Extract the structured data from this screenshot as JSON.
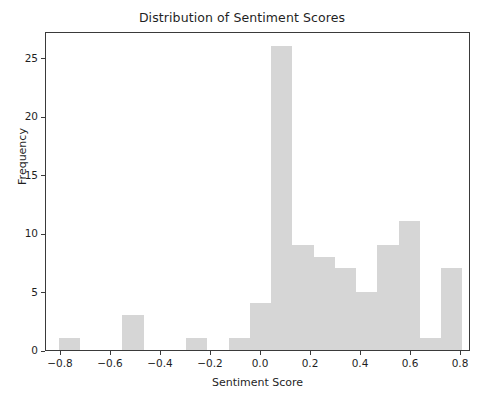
{
  "chart_data": {
    "type": "bar",
    "title": "Distribution of Sentiment Scores",
    "xlabel": "Sentiment Score",
    "ylabel": "Frequency",
    "xlim": [
      -0.86,
      0.84
    ],
    "ylim": [
      0,
      27.3
    ],
    "grid": false,
    "legend": null,
    "bar_color": "#d6d6d6",
    "xticks": [
      -0.8,
      -0.6,
      -0.4,
      -0.2,
      0.0,
      0.2,
      0.4,
      0.6,
      0.8
    ],
    "xtick_labels": [
      "−0.8",
      "−0.6",
      "−0.4",
      "−0.2",
      "0.0",
      "0.2",
      "0.4",
      "0.6",
      "0.8"
    ],
    "yticks": [
      0,
      5,
      10,
      15,
      20,
      25
    ],
    "ytick_labels": [
      "0",
      "5",
      "10",
      "15",
      "20",
      "25"
    ],
    "bins": [
      {
        "left": -0.81,
        "right": -0.725,
        "value": 1
      },
      {
        "left": -0.725,
        "right": -0.64,
        "value": 0
      },
      {
        "left": -0.64,
        "right": -0.555,
        "value": 0
      },
      {
        "left": -0.555,
        "right": -0.47,
        "value": 3
      },
      {
        "left": -0.47,
        "right": -0.385,
        "value": 0
      },
      {
        "left": -0.385,
        "right": -0.3,
        "value": 0
      },
      {
        "left": -0.3,
        "right": -0.215,
        "value": 1
      },
      {
        "left": -0.215,
        "right": -0.13,
        "value": 0
      },
      {
        "left": -0.13,
        "right": -0.045,
        "value": 1
      },
      {
        "left": -0.045,
        "right": 0.04,
        "value": 4
      },
      {
        "left": 0.04,
        "right": 0.125,
        "value": 26
      },
      {
        "left": 0.125,
        "right": 0.21,
        "value": 9
      },
      {
        "left": 0.21,
        "right": 0.295,
        "value": 8
      },
      {
        "left": 0.295,
        "right": 0.38,
        "value": 7
      },
      {
        "left": 0.38,
        "right": 0.465,
        "value": 5
      },
      {
        "left": 0.465,
        "right": 0.55,
        "value": 9
      },
      {
        "left": 0.55,
        "right": 0.635,
        "value": 11
      },
      {
        "left": 0.635,
        "right": 0.72,
        "value": 1
      },
      {
        "left": 0.72,
        "right": 0.805,
        "value": 7
      }
    ]
  }
}
